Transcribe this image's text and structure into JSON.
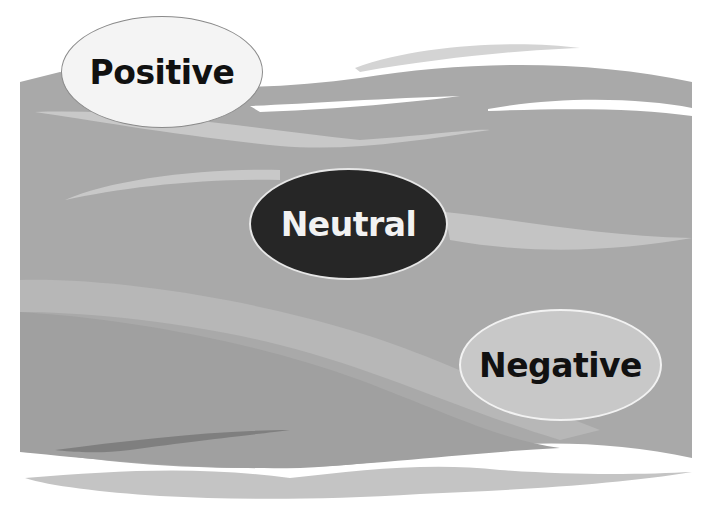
{
  "diagram": {
    "type": "wave-background with three labeled ellipses",
    "colors": {
      "background": "#ffffff",
      "band_main": "#a9a9a9",
      "band_light": "#c6c6c6",
      "band_dark": "#8f8f8f"
    },
    "labels": [
      {
        "id": "positive",
        "text": "Positive",
        "fill": "#f4f4f4",
        "text_color": "#111111"
      },
      {
        "id": "neutral",
        "text": "Neutral",
        "fill": "#262626",
        "text_color": "#f2f2f2"
      },
      {
        "id": "negative",
        "text": "Negative",
        "fill": "#c8c8c8",
        "text_color": "#111111"
      }
    ]
  }
}
